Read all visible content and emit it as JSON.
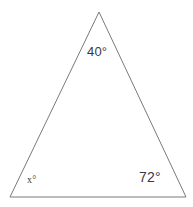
{
  "figure": {
    "background_color": "#ffffff",
    "stroke_color": "#7a7a7a",
    "text_color": "#3a3a3a",
    "width": 193,
    "height": 207
  },
  "shape": {
    "name": "triangle",
    "vertices": [
      {
        "id": "apex",
        "x": 99,
        "y": 12
      },
      {
        "id": "bottom-left",
        "x": 10,
        "y": 197
      },
      {
        "id": "bottom-right",
        "x": 186,
        "y": 197
      }
    ],
    "polygon_points": "99,12 186,197 10,197"
  },
  "labels": {
    "apex": "40°",
    "bottom_left": "x°",
    "bottom_right": "72°"
  },
  "chart_data": {
    "type": "diagram",
    "subtype": "triangle-angle-diagram",
    "vertices": [
      {
        "name": "apex",
        "x": 99,
        "y": 12,
        "angle_label": "40°",
        "angle_value": 40
      },
      {
        "name": "bottom-left",
        "x": 10,
        "y": 197,
        "angle_label": "x°",
        "angle_value": null
      },
      {
        "name": "bottom-right",
        "x": 186,
        "y": 197,
        "angle_label": "72°",
        "angle_value": 72
      }
    ],
    "edges": [
      {
        "from": "apex",
        "to": "bottom-left"
      },
      {
        "from": "apex",
        "to": "bottom-right"
      },
      {
        "from": "bottom-left",
        "to": "bottom-right"
      }
    ],
    "annotations": [
      "40°",
      "x°",
      "72°"
    ],
    "grid": false,
    "legend": null
  }
}
